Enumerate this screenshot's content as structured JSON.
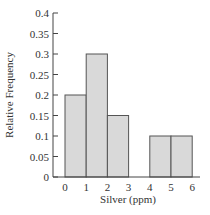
{
  "chart_data": {
    "type": "bar",
    "title": "",
    "xlabel": "Silver (ppm)",
    "ylabel": "Relative Frequency",
    "bins": [
      {
        "from": 0,
        "to": 1,
        "value": 0.2
      },
      {
        "from": 1,
        "to": 2,
        "value": 0.3
      },
      {
        "from": 2,
        "to": 3,
        "value": 0.15
      },
      {
        "from": 3,
        "to": 4,
        "value": 0.0
      },
      {
        "from": 4,
        "to": 5,
        "value": 0.1
      },
      {
        "from": 5,
        "to": 6,
        "value": 0.1
      }
    ],
    "categories": [
      "0-1",
      "1-2",
      "2-3",
      "3-4",
      "4-5",
      "5-6"
    ],
    "values": [
      0.2,
      0.3,
      0.15,
      0.0,
      0.1,
      0.1
    ],
    "xticks": [
      "0",
      "1",
      "2",
      "3",
      "4",
      "5",
      "6"
    ],
    "yticks": [
      "0",
      "0.05",
      "0.1",
      "0.15",
      "0.2",
      "0.25",
      "0.3",
      "0.35",
      "0.4"
    ],
    "xlim": [
      0,
      6
    ],
    "ylim": [
      0,
      0.4
    ],
    "grid": false,
    "legend": null,
    "colors": {
      "bar_fill": "#d9d9d9",
      "bar_edge": "#555555",
      "axis": "#444444"
    }
  }
}
